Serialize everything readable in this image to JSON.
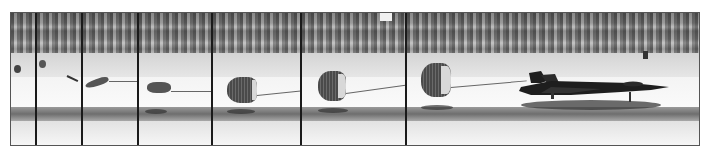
{
  "image": {
    "description": "Sequence of photo frames showing an SR-71 Blackbird landing on a desert runway as its drag chute deploys and inflates",
    "style": "grayscale photographic strip",
    "panel_count": 7,
    "panels": [
      {
        "index": 1,
        "content": "chute pack leaving aircraft"
      },
      {
        "index": 2,
        "content": "pilot chute and bag extending"
      },
      {
        "index": 3,
        "content": "chute streaming, uninflated"
      },
      {
        "index": 4,
        "content": "chute beginning to fill"
      },
      {
        "index": 5,
        "content": "chute partially inflated"
      },
      {
        "index": 6,
        "content": "chute nearly fully inflated"
      },
      {
        "index": 7,
        "content": "fully inflated chute behind SR-71 rolling on runway"
      }
    ],
    "colors": {
      "border": "#555555",
      "divider": "#1a1a1a",
      "aircraft": "#1e1e1e",
      "chute": "#4a4a4a",
      "runway": "#f4f4f4",
      "brush": "#7a7a7a"
    }
  }
}
